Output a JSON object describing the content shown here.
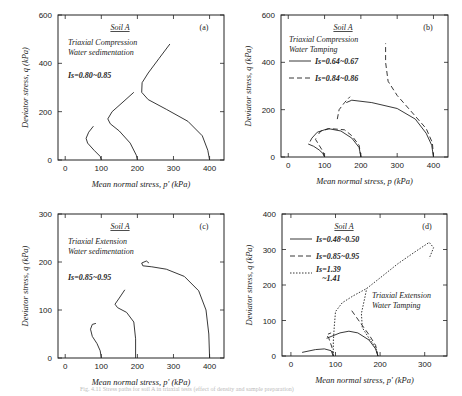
{
  "caption": "Fig. 4.11  Stress paths for soil A in triaxial tests (effect of density and sample preparation)",
  "chart_data": [
    {
      "id": "a",
      "type": "line",
      "panel_label": "(a)",
      "soil": "Soil A",
      "test_lines": [
        "Triaxial Compression",
        "Water sedimentation"
      ],
      "legend_note": "Is=0.80~0.85",
      "xlabel": "Mean normal stress, p'   (kPa)",
      "ylabel": "Deviator stress, q  (kPa)",
      "xlim": [
        -20,
        440
      ],
      "ylim": [
        0,
        600
      ],
      "xticks": [
        0,
        100,
        200,
        300,
        400
      ],
      "yticks": [
        0,
        200,
        400,
        600
      ],
      "series": [
        {
          "name": "p0=100",
          "style": "solid",
          "points": [
            [
              100,
              0
            ],
            [
              97,
              15
            ],
            [
              80,
              40
            ],
            [
              62,
              70
            ],
            [
              58,
              90
            ],
            [
              65,
              115
            ],
            [
              78,
              140
            ]
          ]
        },
        {
          "name": "p0=200",
          "style": "solid",
          "points": [
            [
              200,
              0
            ],
            [
              197,
              20
            ],
            [
              180,
              70
            ],
            [
              150,
              120
            ],
            [
              125,
              150
            ],
            [
              118,
              170
            ],
            [
              130,
              200
            ],
            [
              160,
              240
            ],
            [
              190,
              280
            ]
          ]
        },
        {
          "name": "p0=400",
          "style": "solid",
          "points": [
            [
              400,
              0
            ],
            [
              395,
              40
            ],
            [
              380,
              100
            ],
            [
              340,
              160
            ],
            [
              280,
              210
            ],
            [
              230,
              250
            ],
            [
              212,
              280
            ],
            [
              213,
              320
            ],
            [
              230,
              360
            ],
            [
              260,
              420
            ],
            [
              290,
              480
            ]
          ]
        }
      ]
    },
    {
      "id": "b",
      "type": "line",
      "panel_label": "(b)",
      "soil": "Soil A",
      "test_lines": [
        "Triaxial Compression",
        "Water Tamping"
      ],
      "legend": [
        {
          "style": "solid",
          "label": "Is=0.64~0.67"
        },
        {
          "style": "dashed",
          "label": "Is=0.84~0.86"
        }
      ],
      "xlabel": "Mean normal stress, p   (kPa)",
      "ylabel": "Deviator stress, q  (kPa)",
      "xlim": [
        -20,
        440
      ],
      "ylim": [
        0,
        600
      ],
      "xticks": [
        0,
        100,
        200,
        300,
        400
      ],
      "yticks": [
        0,
        200,
        400,
        600
      ],
      "series": [
        {
          "name": "dense p0=100",
          "style": "solid",
          "points": [
            [
              100,
              0
            ],
            [
              95,
              15
            ],
            [
              85,
              30
            ],
            [
              70,
              45
            ],
            [
              55,
              55
            ]
          ]
        },
        {
          "name": "dense p0=200",
          "style": "solid",
          "points": [
            [
              200,
              0
            ],
            [
              195,
              40
            ],
            [
              175,
              80
            ],
            [
              145,
              110
            ],
            [
              110,
              120
            ],
            [
              80,
              105
            ],
            [
              65,
              80
            ],
            [
              60,
              65
            ]
          ]
        },
        {
          "name": "dense p0=400",
          "style": "solid",
          "points": [
            [
              400,
              0
            ],
            [
              395,
              50
            ],
            [
              380,
              100
            ],
            [
              350,
              160
            ],
            [
              300,
              205
            ],
            [
              230,
              230
            ],
            [
              175,
              240
            ],
            [
              160,
              230
            ]
          ]
        },
        {
          "name": "loose p0=100",
          "style": "dashed",
          "points": [
            [
              100,
              0
            ],
            [
              95,
              25
            ],
            [
              85,
              50
            ],
            [
              75,
              75
            ],
            [
              80,
              90
            ]
          ]
        },
        {
          "name": "loose p0=200",
          "style": "dashed",
          "points": [
            [
              200,
              0
            ],
            [
              195,
              50
            ],
            [
              175,
              90
            ],
            [
              155,
              115
            ],
            [
              115,
              120
            ],
            [
              90,
              110
            ],
            [
              80,
              90
            ]
          ]
        },
        {
          "name": "loose p0=400",
          "style": "dashed",
          "points": [
            [
              400,
              0
            ],
            [
              397,
              60
            ],
            [
              380,
              120
            ],
            [
              340,
              190
            ],
            [
              300,
              260
            ],
            [
              275,
              320
            ],
            [
              268,
              400
            ],
            [
              268,
              480
            ]
          ]
        },
        {
          "name": "loose mid",
          "style": "dashed",
          "points": [
            [
              135,
              160
            ],
            [
              140,
              200
            ],
            [
              155,
              230
            ],
            [
              170,
              255
            ]
          ]
        }
      ]
    },
    {
      "id": "c",
      "type": "line",
      "panel_label": "(c)",
      "soil": "Soil A",
      "test_lines": [
        "Triaxial Extension",
        "Water sedimentation"
      ],
      "legend_note": "Is=0.85~0.95",
      "xlabel": "Mean normal stress, p'   (kPa)",
      "ylabel": "Deviator stress, q  (kPa)",
      "xlim": [
        -20,
        440
      ],
      "ylim": [
        0,
        300
      ],
      "xticks": [
        0,
        100,
        200,
        300,
        400
      ],
      "yticks": [
        0,
        100,
        200,
        300
      ],
      "series": [
        {
          "name": "p0=100",
          "style": "solid",
          "points": [
            [
              100,
              0
            ],
            [
              97,
              15
            ],
            [
              88,
              30
            ],
            [
              75,
              45
            ],
            [
              70,
              60
            ],
            [
              75,
              70
            ],
            [
              85,
              72
            ]
          ]
        },
        {
          "name": "p0=200",
          "style": "solid",
          "points": [
            [
              195,
              0
            ],
            [
              195,
              40
            ],
            [
              190,
              75
            ],
            [
              170,
              95
            ],
            [
              145,
              105
            ],
            [
              138,
              112
            ],
            [
              150,
              125
            ],
            [
              165,
              142
            ]
          ]
        },
        {
          "name": "p0=400",
          "style": "solid",
          "points": [
            [
              400,
              0
            ],
            [
              398,
              50
            ],
            [
              390,
              100
            ],
            [
              370,
              140
            ],
            [
              330,
              170
            ],
            [
              280,
              185
            ],
            [
              240,
              190
            ],
            [
              215,
              192
            ],
            [
              212,
              198
            ],
            [
              225,
              202
            ],
            [
              232,
              198
            ]
          ]
        }
      ]
    },
    {
      "id": "d",
      "type": "line",
      "panel_label": "(d)",
      "soil": "Soil A",
      "test_lines": [
        "Triaxial Extension",
        "Water Tamping"
      ],
      "legend": [
        {
          "style": "solid",
          "label": "Is=0.48~0.50"
        },
        {
          "style": "dashed",
          "label": "Is=0.85~0.95"
        },
        {
          "style": "dotted",
          "label": "Is=1.39 ~1.41"
        }
      ],
      "xlabel": "Mean normal stress, p'   (kPa)",
      "ylabel": "Deviator stress, q  (kPa)",
      "xlim": [
        -20,
        350
      ],
      "ylim": [
        0,
        400
      ],
      "xticks": [
        0,
        100,
        200,
        300
      ],
      "yticks": [
        0,
        100,
        200,
        300,
        400
      ],
      "series": [
        {
          "name": "dense p0=100",
          "style": "solid",
          "points": [
            [
              95,
              0
            ],
            [
              90,
              15
            ],
            [
              75,
              20
            ],
            [
              55,
              18
            ],
            [
              25,
              10
            ]
          ]
        },
        {
          "name": "dense p0=200",
          "style": "solid",
          "points": [
            [
              195,
              0
            ],
            [
              190,
              20
            ],
            [
              175,
              45
            ],
            [
              150,
              65
            ],
            [
              130,
              70
            ],
            [
              110,
              65
            ],
            [
              90,
              55
            ],
            [
              80,
              50
            ]
          ]
        },
        {
          "name": "mid p0=100",
          "style": "dashed",
          "points": [
            [
              95,
              0
            ],
            [
              92,
              25
            ],
            [
              85,
              50
            ],
            [
              80,
              60
            ],
            [
              90,
              65
            ]
          ]
        },
        {
          "name": "mid p0=200",
          "style": "dashed",
          "points": [
            [
              195,
              0
            ],
            [
              190,
              30
            ],
            [
              175,
              60
            ],
            [
              155,
              95
            ],
            [
              135,
              130
            ]
          ]
        },
        {
          "name": "loose p0=100",
          "style": "dotted",
          "points": [
            [
              95,
              0
            ],
            [
              95,
              40
            ],
            [
              97,
              80
            ],
            [
              100,
              125
            ],
            [
              115,
              150
            ],
            [
              140,
              170
            ],
            [
              170,
              190
            ],
            [
              200,
              220
            ],
            [
              240,
              260
            ],
            [
              280,
              295
            ],
            [
              310,
              320
            ],
            [
              320,
              305
            ],
            [
              310,
              275
            ]
          ]
        },
        {
          "name": "loose p0=200",
          "style": "dotted",
          "points": [
            [
              195,
              0
            ],
            [
              190,
              25
            ],
            [
              175,
              50
            ],
            [
              160,
              80
            ],
            [
              158,
              120
            ],
            [
              165,
              160
            ],
            [
              170,
              190
            ]
          ]
        }
      ]
    }
  ]
}
